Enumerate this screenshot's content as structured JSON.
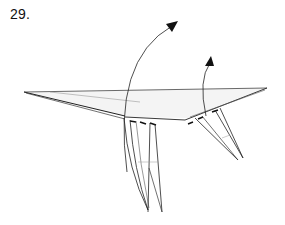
{
  "diagram": {
    "step_label": "29.",
    "arrows": [
      {
        "name": "left-leg-fold-arrow",
        "direction": "up-right"
      },
      {
        "name": "right-leg-fold-arrow",
        "direction": "up"
      }
    ],
    "colors": {
      "line": "#222222",
      "thin_line": "#555555",
      "paper_fill": "#f4f4f4",
      "arrow": "#111111"
    }
  }
}
